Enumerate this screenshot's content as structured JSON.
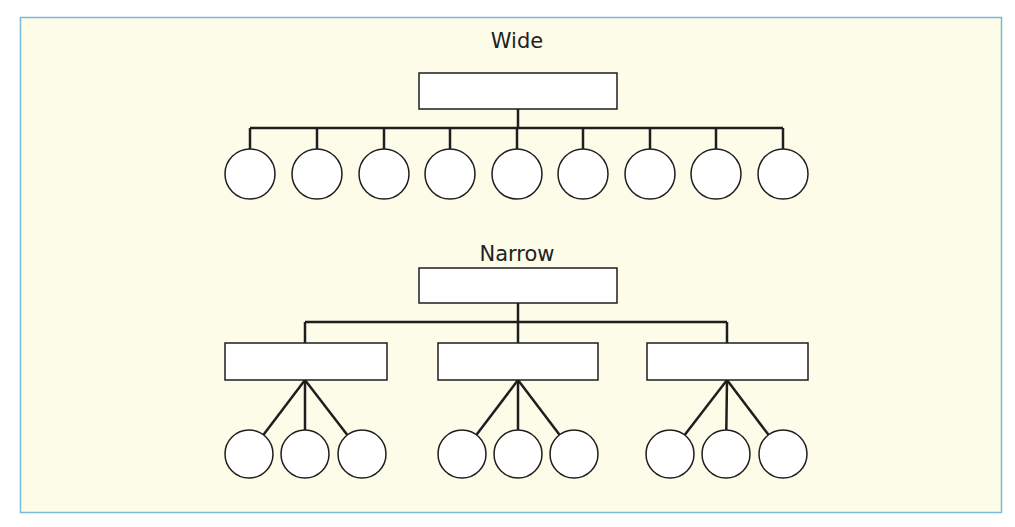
{
  "figure": {
    "background": "#fdfce9",
    "border_color": "#7ab8dc",
    "line_color": "#1e1e1e",
    "node_fill": "#ffffff"
  },
  "wide": {
    "label": "Wide",
    "root": {
      "x": 419,
      "y": 73,
      "w": 198,
      "h": 36
    },
    "bus_y": 128,
    "children": [
      {
        "cx": 250,
        "cy": 174,
        "r": 25
      },
      {
        "cx": 317,
        "cy": 174,
        "r": 25
      },
      {
        "cx": 384,
        "cy": 174,
        "r": 25
      },
      {
        "cx": 450,
        "cy": 174,
        "r": 25
      },
      {
        "cx": 517,
        "cy": 174,
        "r": 25
      },
      {
        "cx": 583,
        "cy": 174,
        "r": 25
      },
      {
        "cx": 650,
        "cy": 174,
        "r": 25
      },
      {
        "cx": 716,
        "cy": 174,
        "r": 25
      },
      {
        "cx": 783,
        "cy": 174,
        "r": 25
      }
    ]
  },
  "narrow": {
    "label": "Narrow",
    "root": {
      "x": 419,
      "y": 268,
      "w": 198,
      "h": 35
    },
    "bus_y": 322,
    "groups": [
      {
        "box": {
          "x": 225,
          "y": 343,
          "w": 162,
          "h": 37
        },
        "anchor_x": 305,
        "leaves": [
          {
            "cx": 249,
            "cy": 454,
            "r": 24
          },
          {
            "cx": 305,
            "cy": 454,
            "r": 24
          },
          {
            "cx": 362,
            "cy": 454,
            "r": 24
          }
        ]
      },
      {
        "box": {
          "x": 438,
          "y": 343,
          "w": 160,
          "h": 37
        },
        "anchor_x": 518,
        "leaves": [
          {
            "cx": 462,
            "cy": 454,
            "r": 24
          },
          {
            "cx": 518,
            "cy": 454,
            "r": 24
          },
          {
            "cx": 574,
            "cy": 454,
            "r": 24
          }
        ]
      },
      {
        "box": {
          "x": 647,
          "y": 343,
          "w": 161,
          "h": 37
        },
        "anchor_x": 727,
        "leaves": [
          {
            "cx": 670,
            "cy": 454,
            "r": 24
          },
          {
            "cx": 726,
            "cy": 454,
            "r": 24
          },
          {
            "cx": 783,
            "cy": 454,
            "r": 24
          }
        ]
      }
    ]
  }
}
